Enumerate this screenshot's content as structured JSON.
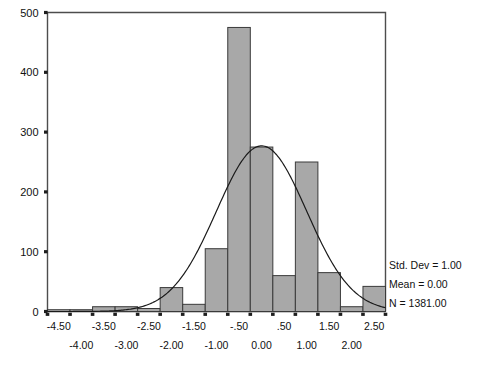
{
  "chart_data": {
    "type": "bar",
    "title": "",
    "subtitle": "",
    "xlabel": "",
    "ylabel": "",
    "xlim": [
      -4.75,
      2.75
    ],
    "ylim": [
      0,
      500
    ],
    "grid": false,
    "legend_position": "right",
    "bin_width": 0.5,
    "categories": [
      "-4.50",
      "-4.00",
      "-3.50",
      "-3.00",
      "-2.50",
      "-2.00",
      "-1.50",
      "-1.00",
      "-0.50",
      "0.00",
      "0.50",
      "1.00",
      "1.50",
      "2.00",
      "2.50",
      "3.00"
    ],
    "bin_centers": [
      -4.5,
      -4.0,
      -3.5,
      -3.0,
      -2.5,
      -2.0,
      -1.5,
      -1.0,
      -0.5,
      0.0,
      0.5,
      1.0,
      1.5,
      2.0,
      2.5,
      3.0
    ],
    "values": [
      3,
      3,
      8,
      8,
      5,
      40,
      12,
      105,
      475,
      275,
      60,
      250,
      65,
      8,
      42,
      0
    ],
    "series": [
      {
        "name": "Frequency",
        "values": [
          3,
          3,
          8,
          8,
          5,
          40,
          12,
          105,
          475,
          275,
          60,
          250,
          65,
          8,
          42,
          0
        ]
      }
    ],
    "overlay_curve": {
      "name": "Normal curve",
      "distribution": "normal",
      "mean": 0.0,
      "std_dev": 1.0,
      "n": 1381,
      "peak_value": 277
    },
    "y_ticks": [
      "0",
      "100",
      "200",
      "300",
      "400",
      "500"
    ],
    "y_tick_values": [
      0,
      100,
      200,
      300,
      400,
      500
    ],
    "x_ticks_upper": [
      "-4.50",
      "-3.50",
      "-2.50",
      "-1.50",
      "-.50",
      ".50",
      "1.50",
      "2.50"
    ],
    "x_tick_upper_values": [
      -4.5,
      -3.5,
      -2.5,
      -1.5,
      -0.5,
      0.5,
      1.5,
      2.5
    ],
    "x_ticks_lower": [
      "-4.00",
      "-3.00",
      "-2.00",
      "-1.00",
      "0.00",
      "1.00",
      "2.00"
    ],
    "x_tick_lower_values": [
      -4.0,
      -3.0,
      -2.0,
      -1.0,
      0.0,
      1.0,
      2.0
    ],
    "annotations": [
      "Std. Dev = 1.00",
      "Mean = 0.00",
      "N = 1381.00"
    ]
  },
  "stats": {
    "std_dev_label": "Std. Dev = 1.00",
    "mean_label": "Mean = 0.00",
    "n_label": "N = 1381.00"
  },
  "colors": {
    "bar_fill": "#a8a8a8",
    "bar_stroke": "#3a3a3a",
    "axis": "#4d4d4d",
    "curve": "#1a1a1a",
    "text": "#111111",
    "background": "#ffffff"
  }
}
